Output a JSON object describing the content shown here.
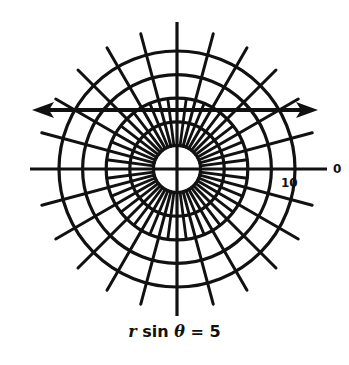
{
  "diagram": {
    "type": "polar-coordinate-grid",
    "center": {
      "x": 177,
      "y": 169
    },
    "scale_px_per_unit": 11.8,
    "circles": {
      "count": 5,
      "radii_units": [
        2,
        4,
        6,
        8,
        10
      ]
    },
    "spokes": {
      "main_step_deg": 15,
      "minor_step_deg": 15,
      "minor_offset_deg": 7.5
    },
    "line": {
      "equation": "r sin θ = 5",
      "y_units": 5,
      "arrows": "both-ends"
    },
    "labels": {
      "angle_zero": "0",
      "radius_ten": "10"
    },
    "stroke_color": "#111111",
    "background": "#ffffff"
  },
  "caption": {
    "r": "r",
    "sin": " sin ",
    "theta": "θ",
    "rest": " = 5"
  }
}
